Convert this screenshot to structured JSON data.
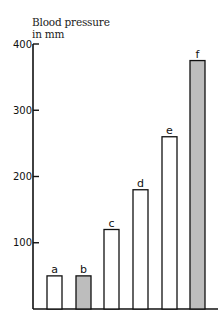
{
  "chart_data": {
    "type": "bar",
    "title": "",
    "ylabel": "Blood pressure in mm",
    "ylabel_lines": [
      "Blood pressure",
      "in mm"
    ],
    "xlabel": "",
    "categories": [
      "a",
      "b",
      "c",
      "d",
      "e",
      "f"
    ],
    "values": [
      50,
      50,
      120,
      180,
      260,
      375
    ],
    "bar_fill": [
      "#ffffff",
      "#bdbdbd",
      "#ffffff",
      "#ffffff",
      "#ffffff",
      "#bdbdbd"
    ],
    "ylim": [
      0,
      400
    ],
    "yticks": [
      100,
      200,
      300,
      400
    ],
    "grid": false,
    "legend": null
  }
}
